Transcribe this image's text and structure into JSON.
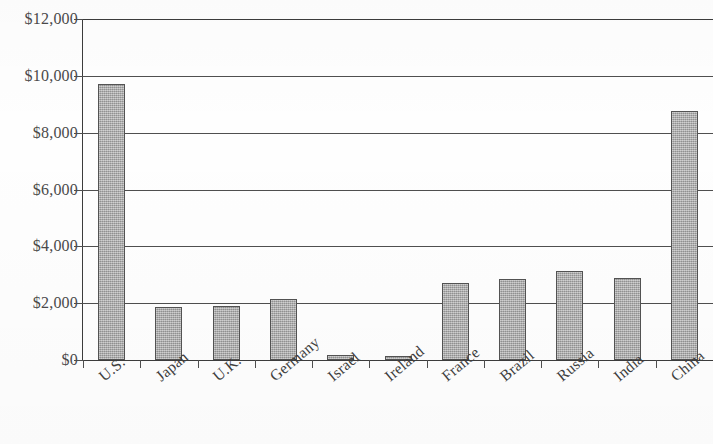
{
  "chart_data": {
    "type": "bar",
    "title": "",
    "xlabel": "",
    "ylabel": "",
    "ylim": [
      0,
      12000
    ],
    "ytick_labels": [
      "$12,000",
      "$10,000",
      "$8,000",
      "$6,000",
      "$4,000",
      "$2,000",
      "$0"
    ],
    "ytick_values": [
      12000,
      10000,
      8000,
      6000,
      4000,
      2000,
      0
    ],
    "grid": true,
    "legend": "none",
    "categories": [
      "U.S.",
      "Japan",
      "U.K.",
      "Germany",
      "Israel",
      "Ireland",
      "France",
      "Brazil",
      "Russia",
      "India",
      "China"
    ],
    "values": [
      9700,
      1850,
      1900,
      2160,
      160,
      150,
      2700,
      2850,
      3150,
      2880,
      8750
    ],
    "bar_color": "#a9a9a9",
    "bar_border_color": "#535353",
    "axis_color": "#3c3c3c",
    "background_color": "#ffffff"
  }
}
